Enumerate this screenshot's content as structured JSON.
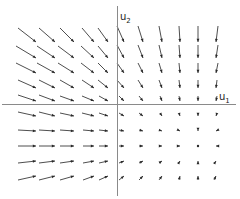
{
  "diagram": {
    "type": "vector_field",
    "title": "",
    "axes": {
      "origin": [
        117,
        104
      ],
      "x_axis": {
        "label": "u",
        "subscript": "1",
        "from": 2,
        "to": 236
      },
      "y_axis": {
        "label": "u",
        "subscript": "2",
        "from": 6,
        "to": 196
      }
    },
    "colors": {
      "axis": "#8a8a8a",
      "arrow": "#3a3a3a",
      "background": "#ffffff"
    },
    "columns_x": [
      36,
      55,
      74,
      94,
      108,
      124,
      143,
      162,
      180,
      198,
      216
    ],
    "rows_y": [
      42,
      58,
      73,
      88,
      101,
      116,
      131,
      146,
      161,
      176
    ],
    "arrows": [
      {
        "r": 0,
        "c": 0,
        "dx": -18,
        "dy": -14
      },
      {
        "r": 0,
        "c": 1,
        "dx": -16,
        "dy": -14
      },
      {
        "r": 0,
        "c": 2,
        "dx": -14,
        "dy": -14
      },
      {
        "r": 0,
        "c": 3,
        "dx": -12,
        "dy": -14
      },
      {
        "r": 0,
        "c": 4,
        "dx": -10,
        "dy": -14
      },
      {
        "r": 0,
        "c": 5,
        "dx": -7,
        "dy": -16
      },
      {
        "r": 0,
        "c": 6,
        "dx": -5,
        "dy": -16
      },
      {
        "r": 0,
        "c": 7,
        "dx": -3,
        "dy": -16
      },
      {
        "r": 0,
        "c": 8,
        "dx": -1,
        "dy": -16
      },
      {
        "r": 0,
        "c": 9,
        "dx": 0,
        "dy": -16
      },
      {
        "r": 0,
        "c": 10,
        "dx": 2,
        "dy": -16
      },
      {
        "r": 1,
        "c": 0,
        "dx": -20,
        "dy": -12
      },
      {
        "r": 1,
        "c": 1,
        "dx": -18,
        "dy": -12
      },
      {
        "r": 1,
        "c": 2,
        "dx": -16,
        "dy": -12
      },
      {
        "r": 1,
        "c": 3,
        "dx": -13,
        "dy": -12
      },
      {
        "r": 1,
        "c": 4,
        "dx": -10,
        "dy": -12
      },
      {
        "r": 1,
        "c": 5,
        "dx": -7,
        "dy": -13
      },
      {
        "r": 1,
        "c": 6,
        "dx": -5,
        "dy": -13
      },
      {
        "r": 1,
        "c": 7,
        "dx": -3,
        "dy": -13
      },
      {
        "r": 1,
        "c": 8,
        "dx": -1,
        "dy": -13
      },
      {
        "r": 1,
        "c": 9,
        "dx": 0,
        "dy": -13
      },
      {
        "r": 1,
        "c": 10,
        "dx": 2,
        "dy": -13
      },
      {
        "r": 2,
        "c": 0,
        "dx": -20,
        "dy": -10
      },
      {
        "r": 2,
        "c": 1,
        "dx": -18,
        "dy": -10
      },
      {
        "r": 2,
        "c": 2,
        "dx": -16,
        "dy": -10
      },
      {
        "r": 2,
        "c": 3,
        "dx": -13,
        "dy": -10
      },
      {
        "r": 2,
        "c": 4,
        "dx": -10,
        "dy": -10
      },
      {
        "r": 2,
        "c": 5,
        "dx": -7,
        "dy": -10
      },
      {
        "r": 2,
        "c": 6,
        "dx": -5,
        "dy": -10
      },
      {
        "r": 2,
        "c": 7,
        "dx": -3,
        "dy": -10
      },
      {
        "r": 2,
        "c": 8,
        "dx": -1,
        "dy": -10
      },
      {
        "r": 2,
        "c": 9,
        "dx": 0,
        "dy": -10
      },
      {
        "r": 2,
        "c": 10,
        "dx": 2,
        "dy": -10
      },
      {
        "r": 3,
        "c": 0,
        "dx": -18,
        "dy": -8
      },
      {
        "r": 3,
        "c": 1,
        "dx": -16,
        "dy": -8
      },
      {
        "r": 3,
        "c": 2,
        "dx": -14,
        "dy": -8
      },
      {
        "r": 3,
        "c": 3,
        "dx": -12,
        "dy": -8
      },
      {
        "r": 3,
        "c": 4,
        "dx": -10,
        "dy": -8
      },
      {
        "r": 3,
        "c": 5,
        "dx": -7,
        "dy": -8
      },
      {
        "r": 3,
        "c": 6,
        "dx": -5,
        "dy": -8
      },
      {
        "r": 3,
        "c": 7,
        "dx": -3,
        "dy": -8
      },
      {
        "r": 3,
        "c": 8,
        "dx": -1,
        "dy": -8
      },
      {
        "r": 3,
        "c": 9,
        "dx": 0,
        "dy": -8
      },
      {
        "r": 3,
        "c": 10,
        "dx": 1,
        "dy": -8
      },
      {
        "r": 4,
        "c": 0,
        "dx": -18,
        "dy": -6
      },
      {
        "r": 4,
        "c": 1,
        "dx": -16,
        "dy": -6
      },
      {
        "r": 4,
        "c": 2,
        "dx": -14,
        "dy": -5
      },
      {
        "r": 4,
        "c": 3,
        "dx": -12,
        "dy": -5
      },
      {
        "r": 4,
        "c": 4,
        "dx": -9,
        "dy": -5
      },
      {
        "r": 4,
        "c": 5,
        "dx": -5,
        "dy": -5
      },
      {
        "r": 4,
        "c": 6,
        "dx": -4,
        "dy": -5
      },
      {
        "r": 4,
        "c": 7,
        "dx": -2,
        "dy": -5
      },
      {
        "r": 4,
        "c": 8,
        "dx": -1,
        "dy": -5
      },
      {
        "r": 4,
        "c": 9,
        "dx": 0,
        "dy": -5
      },
      {
        "r": 4,
        "c": 10,
        "dx": 1,
        "dy": -5
      },
      {
        "r": 5,
        "c": 0,
        "dx": -18,
        "dy": -4
      },
      {
        "r": 5,
        "c": 1,
        "dx": -16,
        "dy": -4
      },
      {
        "r": 5,
        "c": 2,
        "dx": -14,
        "dy": -3
      },
      {
        "r": 5,
        "c": 3,
        "dx": -12,
        "dy": -3
      },
      {
        "r": 5,
        "c": 4,
        "dx": -9,
        "dy": -3
      },
      {
        "r": 5,
        "c": 5,
        "dx": -5,
        "dy": -3
      },
      {
        "r": 5,
        "c": 6,
        "dx": -4,
        "dy": -3
      },
      {
        "r": 5,
        "c": 7,
        "dx": -2,
        "dy": -3
      },
      {
        "r": 5,
        "c": 8,
        "dx": -1,
        "dy": -3
      },
      {
        "r": 5,
        "c": 9,
        "dx": 0,
        "dy": -3
      },
      {
        "r": 5,
        "c": 10,
        "dx": 1,
        "dy": -3
      },
      {
        "r": 6,
        "c": 0,
        "dx": -18,
        "dy": -1
      },
      {
        "r": 6,
        "c": 1,
        "dx": -16,
        "dy": -1
      },
      {
        "r": 6,
        "c": 2,
        "dx": -14,
        "dy": -1
      },
      {
        "r": 6,
        "c": 3,
        "dx": -11,
        "dy": -1
      },
      {
        "r": 6,
        "c": 4,
        "dx": -9,
        "dy": -1
      },
      {
        "r": 6,
        "c": 5,
        "dx": -5,
        "dy": -1
      },
      {
        "r": 6,
        "c": 6,
        "dx": -4,
        "dy": -1
      },
      {
        "r": 6,
        "c": 7,
        "dx": -3,
        "dy": -1
      },
      {
        "r": 6,
        "c": 8,
        "dx": -2,
        "dy": -1
      },
      {
        "r": 6,
        "c": 9,
        "dx": 0,
        "dy": -1
      },
      {
        "r": 6,
        "c": 10,
        "dx": 2,
        "dy": -1
      },
      {
        "r": 7,
        "c": 0,
        "dx": -18,
        "dy": 0
      },
      {
        "r": 7,
        "c": 1,
        "dx": -16,
        "dy": 0
      },
      {
        "r": 7,
        "c": 2,
        "dx": -14,
        "dy": 0
      },
      {
        "r": 7,
        "c": 3,
        "dx": -11,
        "dy": 0
      },
      {
        "r": 7,
        "c": 4,
        "dx": -9,
        "dy": 0
      },
      {
        "r": 7,
        "c": 5,
        "dx": -5,
        "dy": 0
      },
      {
        "r": 7,
        "c": 6,
        "dx": -4,
        "dy": 0
      },
      {
        "r": 7,
        "c": 7,
        "dx": -3,
        "dy": 0
      },
      {
        "r": 7,
        "c": 8,
        "dx": -2,
        "dy": 0
      },
      {
        "r": 7,
        "c": 9,
        "dx": 0,
        "dy": 0
      },
      {
        "r": 7,
        "c": 10,
        "dx": 2,
        "dy": 0
      },
      {
        "r": 8,
        "c": 0,
        "dx": -18,
        "dy": 2
      },
      {
        "r": 8,
        "c": 1,
        "dx": -16,
        "dy": 2
      },
      {
        "r": 8,
        "c": 2,
        "dx": -14,
        "dy": 2
      },
      {
        "r": 8,
        "c": 3,
        "dx": -11,
        "dy": 2
      },
      {
        "r": 8,
        "c": 4,
        "dx": -9,
        "dy": 2
      },
      {
        "r": 8,
        "c": 5,
        "dx": -5,
        "dy": 2
      },
      {
        "r": 8,
        "c": 6,
        "dx": -4,
        "dy": 2
      },
      {
        "r": 8,
        "c": 7,
        "dx": -3,
        "dy": 2
      },
      {
        "r": 8,
        "c": 8,
        "dx": -2,
        "dy": 3
      },
      {
        "r": 8,
        "c": 9,
        "dx": 0,
        "dy": 3
      },
      {
        "r": 8,
        "c": 10,
        "dx": -2,
        "dy": 3
      },
      {
        "r": 9,
        "c": 0,
        "dx": -18,
        "dy": 4
      },
      {
        "r": 9,
        "c": 1,
        "dx": -16,
        "dy": 4
      },
      {
        "r": 9,
        "c": 2,
        "dx": -14,
        "dy": 4
      },
      {
        "r": 9,
        "c": 3,
        "dx": -11,
        "dy": 4
      },
      {
        "r": 9,
        "c": 4,
        "dx": -9,
        "dy": 4
      },
      {
        "r": 9,
        "c": 5,
        "dx": -5,
        "dy": 4
      },
      {
        "r": 9,
        "c": 6,
        "dx": -4,
        "dy": 4
      },
      {
        "r": 9,
        "c": 7,
        "dx": -3,
        "dy": 4
      },
      {
        "r": 9,
        "c": 8,
        "dx": -1,
        "dy": 4
      },
      {
        "r": 9,
        "c": 9,
        "dx": 0,
        "dy": 4
      },
      {
        "r": 9,
        "c": 10,
        "dx": -2,
        "dy": 4
      }
    ]
  }
}
